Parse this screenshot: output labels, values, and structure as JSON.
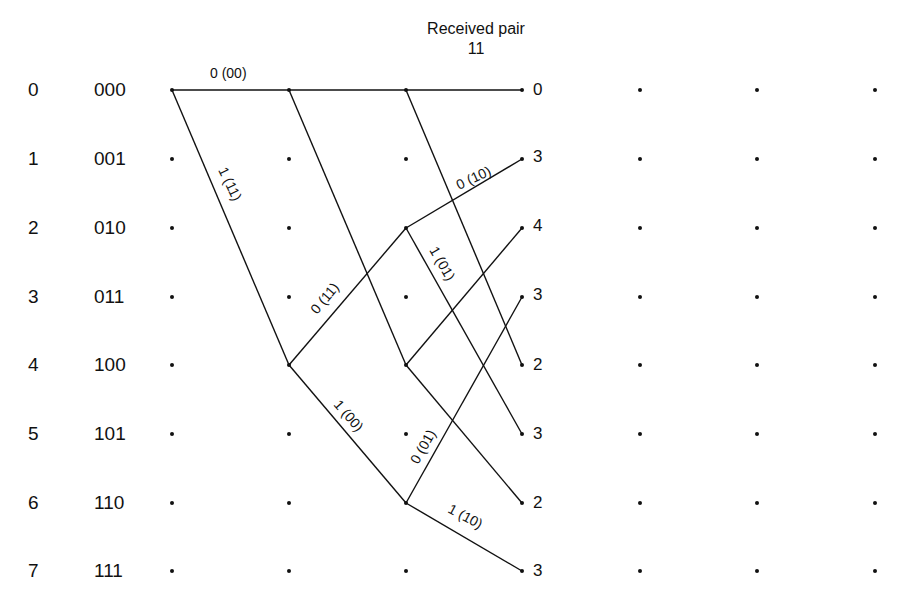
{
  "header": {
    "title_line1": "Received pair",
    "title_line2": "11"
  },
  "states": [
    {
      "index": "0",
      "bits": "000"
    },
    {
      "index": "1",
      "bits": "001"
    },
    {
      "index": "2",
      "bits": "010"
    },
    {
      "index": "3",
      "bits": "011"
    },
    {
      "index": "4",
      "bits": "100"
    },
    {
      "index": "5",
      "bits": "101"
    },
    {
      "index": "6",
      "bits": "110"
    },
    {
      "index": "7",
      "bits": "111"
    }
  ],
  "path_metrics": [
    "0",
    "3",
    "4",
    "3",
    "2",
    "3",
    "2",
    "3"
  ],
  "edge_labels": {
    "e0": "0 (00)",
    "e1": "1 (11)",
    "e2": "0 (11)",
    "e3": "1 (00)",
    "e4": "0 (10)",
    "e5": "1 (01)",
    "e6": "0 (01)",
    "e7": "1 (10)"
  },
  "trellis": {
    "columns_x": [
      172,
      289,
      406,
      522,
      640,
      757,
      875
    ],
    "rows_y": [
      90,
      159,
      228,
      297,
      365,
      434,
      503,
      571
    ],
    "edges": [
      {
        "from_col": 0,
        "from": 0,
        "to": 0,
        "label": "0 (00)"
      },
      {
        "from_col": 0,
        "from": 0,
        "to": 4,
        "label": "1 (11)"
      },
      {
        "from_col": 1,
        "from": 0,
        "to": 0
      },
      {
        "from_col": 1,
        "from": 0,
        "to": 4
      },
      {
        "from_col": 1,
        "from": 4,
        "to": 2,
        "label": "0 (11)"
      },
      {
        "from_col": 1,
        "from": 4,
        "to": 6,
        "label": "1 (00)"
      },
      {
        "from_col": 2,
        "from": 0,
        "to": 0
      },
      {
        "from_col": 2,
        "from": 0,
        "to": 4
      },
      {
        "from_col": 2,
        "from": 2,
        "to": 1,
        "label": "0 (10)"
      },
      {
        "from_col": 2,
        "from": 2,
        "to": 5,
        "label": "1 (01)"
      },
      {
        "from_col": 2,
        "from": 4,
        "to": 2
      },
      {
        "from_col": 2,
        "from": 4,
        "to": 6
      },
      {
        "from_col": 2,
        "from": 6,
        "to": 3,
        "label": "0 (01)"
      },
      {
        "from_col": 2,
        "from": 6,
        "to": 7,
        "label": "1 (10)"
      }
    ]
  }
}
